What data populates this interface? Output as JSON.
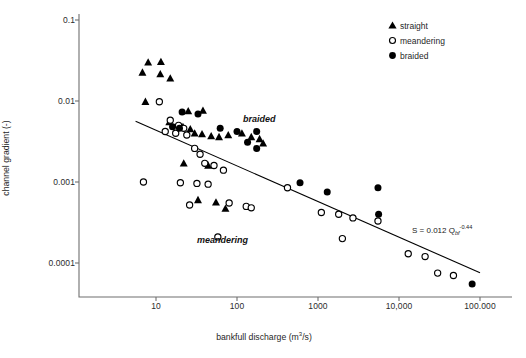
{
  "chart_data": {
    "type": "scatter",
    "title": "",
    "xlabel": "bankfull discharge (m3/s)",
    "xlabel_display": "bankfull discharge (m³/s)",
    "ylabel": "channel gradient (-)",
    "xscale": "log",
    "yscale": "log",
    "xlim": [
      5,
      100000
    ],
    "ylim": [
      4e-05,
      0.1
    ],
    "grid": false,
    "legend_position": "top-right",
    "xticks": [
      10,
      100,
      1000,
      10000,
      100000
    ],
    "xtick_labels": [
      "10",
      "100",
      "1000",
      "10,000",
      "100.000"
    ],
    "yticks": [
      0.1,
      0.01,
      0.001,
      0.0001
    ],
    "ytick_labels": [
      "0.1",
      "0.01",
      "0.001",
      "0.0001"
    ],
    "series": [
      {
        "name": "straight",
        "marker": "filled-triangle",
        "color": "#000000",
        "points": [
          [
            8.0,
            0.03
          ],
          [
            11.5,
            0.0305
          ],
          [
            6.8,
            0.0225
          ],
          [
            11.3,
            0.0215
          ],
          [
            15.0,
            0.019
          ],
          [
            7.4,
            0.0098
          ],
          [
            25.0,
            0.0075
          ],
          [
            38.0,
            0.0076
          ],
          [
            14.6,
            0.0055
          ],
          [
            21.5,
            0.0048
          ],
          [
            26.5,
            0.0045
          ],
          [
            30.0,
            0.004
          ],
          [
            37.0,
            0.0039
          ],
          [
            48.0,
            0.0037
          ],
          [
            60.0,
            0.0036
          ],
          [
            78.0,
            0.0038
          ],
          [
            115.0,
            0.004
          ],
          [
            150.0,
            0.0036
          ],
          [
            190.0,
            0.0034
          ],
          [
            22.0,
            0.0017
          ],
          [
            44.0,
            0.0016
          ],
          [
            33.0,
            0.0006
          ],
          [
            55.0,
            0.00056
          ],
          [
            72.0,
            0.00047
          ],
          [
            210.0,
            0.003
          ]
        ]
      },
      {
        "name": "meandering",
        "marker": "open-circle",
        "color": "#000000",
        "points": [
          [
            11.0,
            0.0098
          ],
          [
            15.0,
            0.0058
          ],
          [
            19.0,
            0.005
          ],
          [
            22.0,
            0.0046
          ],
          [
            13.0,
            0.0042
          ],
          [
            17.5,
            0.004
          ],
          [
            24.0,
            0.0038
          ],
          [
            30.0,
            0.0026
          ],
          [
            35.0,
            0.0022
          ],
          [
            40.0,
            0.0017
          ],
          [
            52.0,
            0.0016
          ],
          [
            68.0,
            0.0014
          ],
          [
            7.0,
            0.001
          ],
          [
            20.0,
            0.00098
          ],
          [
            32.0,
            0.00096
          ],
          [
            44.0,
            0.00094
          ],
          [
            26.0,
            0.00052
          ],
          [
            80.0,
            0.00055
          ],
          [
            130.0,
            0.0005
          ],
          [
            150.0,
            0.00048
          ],
          [
            58.0,
            0.00021
          ],
          [
            420.0,
            0.00085
          ],
          [
            1100.0,
            0.00042
          ],
          [
            1800.0,
            0.0004
          ],
          [
            2700.0,
            0.00036
          ],
          [
            5500.0,
            0.00033
          ],
          [
            2000.0,
            0.0002
          ],
          [
            13000.0,
            0.00013
          ],
          [
            21000.0,
            0.00012
          ],
          [
            30000.0,
            7.5e-05
          ],
          [
            47000.0,
            7e-05
          ]
        ]
      },
      {
        "name": "braided",
        "marker": "filled-circle",
        "color": "#000000",
        "points": [
          [
            21.0,
            0.0073
          ],
          [
            33.0,
            0.0069
          ],
          [
            16.0,
            0.0048
          ],
          [
            19.5,
            0.0046
          ],
          [
            62.0,
            0.0046
          ],
          [
            100.0,
            0.0042
          ],
          [
            175.0,
            0.0042
          ],
          [
            135.0,
            0.0031
          ],
          [
            175.0,
            0.0026
          ],
          [
            600.0,
            0.00098
          ],
          [
            1300.0,
            0.00075
          ],
          [
            5500.0,
            0.00085
          ],
          [
            5600.0,
            0.0004
          ],
          [
            80000.0,
            5.5e-05
          ]
        ]
      }
    ],
    "fit_line": {
      "equation_text": "S = 0.012 Qbf-0.44",
      "coefficient": 0.012,
      "exponent": -0.44,
      "label_prefix": "S = 0.012 Q",
      "label_subscript": "bf",
      "label_superscript": "-0.44"
    },
    "annotations": [
      {
        "text": "braided",
        "x": 150,
        "y": 0.0068,
        "style": "bold-italic"
      },
      {
        "text": "meandering",
        "x": 45,
        "y": 0.00035,
        "style": "bold-italic"
      }
    ]
  },
  "axes": {
    "y_title": "channel gradient (-)",
    "x_title_prefix": "bankfull discharge (m",
    "x_title_sup": "3",
    "x_title_suffix": "/s)",
    "x_tick_labels": [
      "10",
      "100",
      "1000",
      "10,000",
      "100.000"
    ],
    "y_tick_labels": [
      "0.1",
      "0.01",
      "0.001",
      "0.0001"
    ]
  },
  "legend": {
    "items": [
      {
        "label": "straight",
        "marker": "filled-triangle"
      },
      {
        "label": "meandering",
        "marker": "open-circle"
      },
      {
        "label": "braided",
        "marker": "filled-circle"
      }
    ]
  },
  "colors": {
    "marker": "#000000",
    "axis": "#6f6f6f",
    "text": "#1f1f1f",
    "background": "#ffffff"
  }
}
